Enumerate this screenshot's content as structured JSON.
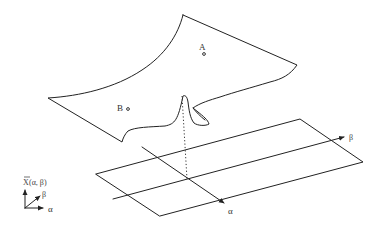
{
  "figure": {
    "surface_points": [
      {
        "label": "A"
      },
      {
        "label": "B"
      }
    ],
    "plane_axes": {
      "alpha_label": "α",
      "beta_label": "β"
    },
    "legend": {
      "vertical_label_bar": "X",
      "vertical_label_args": "(α, β)",
      "beta_label": "β",
      "alpha_label": "α"
    },
    "colors": {
      "line": "#222222",
      "background": "#ffffff"
    }
  }
}
